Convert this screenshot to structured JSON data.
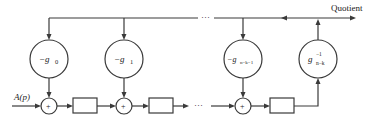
{
  "diagram": {
    "output_label": "Quotient",
    "input_label": "A(p)",
    "ellipsis": "···",
    "adder_symbol": "+",
    "feedback_multipliers": [
      {
        "label_main": "−g",
        "label_sub": "0"
      },
      {
        "label_main": "−g",
        "label_sub": "1"
      },
      {
        "label_main": "−g",
        "label_sub": "n−k−1"
      }
    ],
    "inverse_multiplier": {
      "label_main": "g",
      "label_sup": "−1",
      "label_sub": "n−k"
    },
    "delay_elements": 3,
    "colors": {
      "line": "#3a3a3a",
      "background": "#ffffff"
    }
  }
}
